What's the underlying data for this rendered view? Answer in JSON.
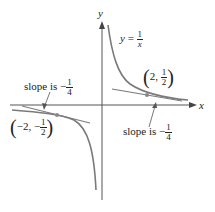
{
  "diagram": {
    "axes": {
      "x_label": "x",
      "y_label": "y"
    },
    "function_label": {
      "lhs": "y",
      "eq": "=",
      "num": "1",
      "den": "x"
    },
    "points": [
      {
        "label_x": "2,",
        "num": "1",
        "den": "2"
      },
      {
        "label_x": "−2, −",
        "num": "1",
        "den": "2"
      }
    ],
    "slope_labels": [
      {
        "text": "slope is −",
        "num": "1",
        "den": "4"
      },
      {
        "text": "slope is −",
        "num": "1",
        "den": "4"
      }
    ],
    "colors": {
      "curve": "#7a7a7a",
      "axis": "#555555",
      "text": "#222222",
      "point": "#888888"
    }
  }
}
